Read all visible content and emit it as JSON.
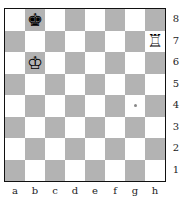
{
  "board": {
    "files": [
      "a",
      "b",
      "c",
      "d",
      "e",
      "f",
      "g",
      "h"
    ],
    "ranks": [
      "8",
      "7",
      "6",
      "5",
      "4",
      "3",
      "2",
      "1"
    ],
    "colors": {
      "light": "#ffffff",
      "dark": "#b3b3b3",
      "border": "#111111"
    },
    "pieces": [
      {
        "square": "b8",
        "piece": "black-king",
        "glyph": "♚"
      },
      {
        "square": "h7",
        "piece": "white-rook",
        "glyph": "♖"
      },
      {
        "square": "b6",
        "piece": "white-king",
        "glyph": "♔"
      }
    ],
    "markers": [
      {
        "square": "g4",
        "type": "dot"
      }
    ]
  }
}
